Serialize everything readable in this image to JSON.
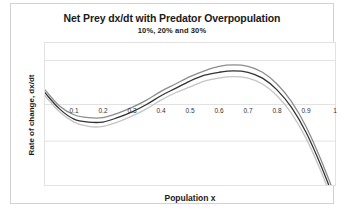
{
  "chart_data": {
    "type": "line",
    "title": "Net Prey dx/dt with Predator Overpopulation",
    "subtitle": "10%,  20%  and 30%",
    "xlabel": "Population x",
    "ylabel": "Rate of change, dx/dt",
    "xlim": [
      0,
      1
    ],
    "ylim": [
      -0.55,
      0.42
    ],
    "grid": true,
    "legend": "none",
    "x_tick_labels": [
      "0.1",
      "0.2",
      "0.3",
      "0.4",
      "0.5",
      "0.6",
      "0.7",
      "0.8",
      "0.9",
      "1"
    ],
    "x_ticks": [
      0.1,
      0.2,
      0.3,
      0.4,
      0.5,
      0.6,
      0.7,
      0.8,
      0.9,
      1.0
    ],
    "y_gridlines": [
      0.3,
      0.0,
      -0.25
    ],
    "x": [
      0.0,
      0.05,
      0.1,
      0.15,
      0.2,
      0.25,
      0.3,
      0.35,
      0.4,
      0.45,
      0.5,
      0.55,
      0.6,
      0.65,
      0.7,
      0.75,
      0.8,
      0.85,
      0.9,
      0.95,
      1.0
    ],
    "series": [
      {
        "name": "10%",
        "color": "#8c8c8c",
        "values": [
          0.1,
          -0.01,
          -0.07,
          -0.09,
          -0.09,
          -0.06,
          -0.02,
          0.03,
          0.09,
          0.14,
          0.19,
          0.23,
          0.26,
          0.27,
          0.26,
          0.22,
          0.14,
          0.02,
          -0.15,
          -0.37,
          -0.62
        ]
      },
      {
        "name": "20%",
        "color": "#333333",
        "values": [
          0.08,
          -0.03,
          -0.1,
          -0.12,
          -0.12,
          -0.09,
          -0.05,
          0.0,
          0.06,
          0.11,
          0.16,
          0.2,
          0.22,
          0.23,
          0.22,
          0.18,
          0.1,
          -0.02,
          -0.19,
          -0.41,
          -0.66
        ]
      },
      {
        "name": "30%",
        "color": "#c4c4c4",
        "values": [
          0.06,
          -0.05,
          -0.12,
          -0.15,
          -0.15,
          -0.12,
          -0.08,
          -0.03,
          0.03,
          0.08,
          0.12,
          0.16,
          0.18,
          0.19,
          0.18,
          0.14,
          0.06,
          -0.06,
          -0.23,
          -0.45,
          -0.7
        ]
      }
    ]
  }
}
